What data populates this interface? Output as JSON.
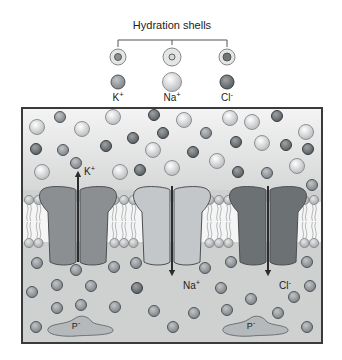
{
  "diagram": {
    "title": "Hydration shells",
    "legend": [
      {
        "id": "k",
        "label": "K",
        "sup": "+",
        "x": 118,
        "color": "#8a8f92",
        "shell_r": 8,
        "core_r": 3.5,
        "ion_r": 7
      },
      {
        "id": "na",
        "label": "Na",
        "sup": "+",
        "x": 172,
        "color": "#d6d8d9",
        "shell_r": 9,
        "core_r": 3,
        "ion_r": 9.5
      },
      {
        "id": "cl",
        "label": "Cl",
        "sup": "-",
        "x": 227,
        "color": "#6f7477",
        "shell_r": 8,
        "core_r": 4,
        "ion_r": 7
      }
    ],
    "channels": [
      {
        "id": "k-channel",
        "ion": "K",
        "sup": "+",
        "x": 78,
        "fill": "#8b8f92",
        "direction": "up",
        "label_x": 84,
        "label_y": 175
      },
      {
        "id": "na-channel",
        "ion": "Na",
        "sup": "+",
        "x": 172,
        "fill": "#c4c7c9",
        "direction": "down",
        "label_x": 183,
        "label_y": 289
      },
      {
        "id": "cl-channel",
        "ion": "Cl",
        "sup": "-",
        "x": 268,
        "fill": "#6c7174",
        "direction": "down",
        "label_x": 279,
        "label_y": 289
      }
    ],
    "proteins": [
      {
        "label": "P",
        "sup": "-",
        "x": 80,
        "y": 327
      },
      {
        "label": "P",
        "sup": "-",
        "x": 255,
        "y": 327
      }
    ],
    "outside_ions": [
      {
        "t": "k",
        "x": 60,
        "y": 117
      },
      {
        "t": "na",
        "x": 37,
        "y": 127
      },
      {
        "t": "na",
        "x": 82,
        "y": 129
      },
      {
        "t": "na",
        "x": 113,
        "y": 117
      },
      {
        "t": "cl",
        "x": 154,
        "y": 115
      },
      {
        "t": "na",
        "x": 184,
        "y": 120
      },
      {
        "t": "na",
        "x": 230,
        "y": 118
      },
      {
        "t": "na",
        "x": 252,
        "y": 122
      },
      {
        "t": "cl",
        "x": 277,
        "y": 116
      },
      {
        "t": "na",
        "x": 306,
        "y": 132
      },
      {
        "t": "cl",
        "x": 36,
        "y": 149
      },
      {
        "t": "k",
        "x": 63,
        "y": 150
      },
      {
        "t": "cl",
        "x": 106,
        "y": 146
      },
      {
        "t": "cl",
        "x": 133,
        "y": 138
      },
      {
        "t": "cl",
        "x": 163,
        "y": 133
      },
      {
        "t": "na",
        "x": 153,
        "y": 150
      },
      {
        "t": "k",
        "x": 206,
        "y": 133
      },
      {
        "t": "cl",
        "x": 236,
        "y": 142
      },
      {
        "t": "na",
        "x": 262,
        "y": 143
      },
      {
        "t": "cl",
        "x": 286,
        "y": 145
      },
      {
        "t": "cl",
        "x": 308,
        "y": 149
      },
      {
        "t": "cl",
        "x": 193,
        "y": 152
      },
      {
        "t": "na",
        "x": 42,
        "y": 172
      },
      {
        "t": "k",
        "x": 76,
        "y": 163
      },
      {
        "t": "na",
        "x": 120,
        "y": 172
      },
      {
        "t": "cl",
        "x": 140,
        "y": 170
      },
      {
        "t": "na",
        "x": 172,
        "y": 168
      },
      {
        "t": "na",
        "x": 217,
        "y": 161
      },
      {
        "t": "cl",
        "x": 238,
        "y": 172
      },
      {
        "t": "k",
        "x": 267,
        "y": 173
      },
      {
        "t": "na",
        "x": 297,
        "y": 166
      },
      {
        "t": "k",
        "x": 312,
        "y": 185
      }
    ],
    "inside_ions": [
      {
        "t": "k",
        "x": 37,
        "y": 263
      },
      {
        "t": "k",
        "x": 76,
        "y": 270
      },
      {
        "t": "k",
        "x": 114,
        "y": 267
      },
      {
        "t": "k",
        "x": 136,
        "y": 263
      },
      {
        "t": "k",
        "x": 205,
        "y": 268
      },
      {
        "t": "k",
        "x": 231,
        "y": 262
      },
      {
        "t": "k",
        "x": 307,
        "y": 262
      },
      {
        "t": "k",
        "x": 32,
        "y": 292
      },
      {
        "t": "k",
        "x": 57,
        "y": 285
      },
      {
        "t": "k",
        "x": 91,
        "y": 286
      },
      {
        "t": "cl",
        "x": 137,
        "y": 288
      },
      {
        "t": "k",
        "x": 221,
        "y": 288
      },
      {
        "t": "k",
        "x": 310,
        "y": 286
      },
      {
        "t": "k",
        "x": 57,
        "y": 308
      },
      {
        "t": "k",
        "x": 81,
        "y": 305
      },
      {
        "t": "k",
        "x": 115,
        "y": 307
      },
      {
        "t": "k",
        "x": 154,
        "y": 311
      },
      {
        "t": "k",
        "x": 194,
        "y": 313
      },
      {
        "t": "k",
        "x": 227,
        "y": 310
      },
      {
        "t": "k",
        "x": 251,
        "y": 299
      },
      {
        "t": "k",
        "x": 294,
        "y": 297
      },
      {
        "t": "k",
        "x": 278,
        "y": 313
      },
      {
        "t": "k",
        "x": 36,
        "y": 327
      },
      {
        "t": "k",
        "x": 173,
        "y": 327
      },
      {
        "t": "k",
        "x": 307,
        "y": 327
      }
    ],
    "colors": {
      "frame": "#3a3a3a",
      "outside_bg_top": "#f4f4f4",
      "outside_bg_bottom": "#d8d9d9",
      "inside_bg": "#cfd0d0",
      "membrane_core": "#f7f7f7",
      "lipid_head": "#bdbfc0",
      "arrow": "#2c2c2c",
      "protein": "#b6b9bb"
    }
  }
}
